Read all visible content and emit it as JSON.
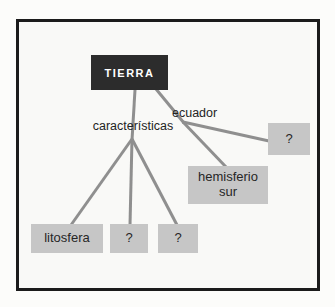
{
  "diagram": {
    "root": {
      "label": "TIERRA"
    },
    "edge_labels": {
      "caracteristicas": "características",
      "ecuador": "ecuador"
    },
    "nodes": {
      "litosfera": {
        "label": "litosfera"
      },
      "unknown_1": {
        "label": "?"
      },
      "unknown_2": {
        "label": "?"
      },
      "hemisferio_sur": {
        "label": "hemisferio sur"
      },
      "unknown_3": {
        "label": "?"
      }
    },
    "edges": [
      {
        "from": "TIERRA",
        "via": "características",
        "to": "litosfera"
      },
      {
        "from": "TIERRA",
        "via": "características",
        "to": "?"
      },
      {
        "from": "TIERRA",
        "via": "características",
        "to": "?"
      },
      {
        "from": "TIERRA",
        "via": "ecuador",
        "to": "hemisferio sur"
      },
      {
        "from": "TIERRA",
        "via": "ecuador",
        "to": "?"
      }
    ],
    "colors": {
      "root_bg": "#2c2c2c",
      "root_text": "#ffffff",
      "node_bg": "#c6c6c6",
      "node_text": "#262626",
      "connector": "#8f8f8f",
      "frame_border": "#1b1b1b",
      "frame_bg": "#f9f9f7"
    }
  }
}
